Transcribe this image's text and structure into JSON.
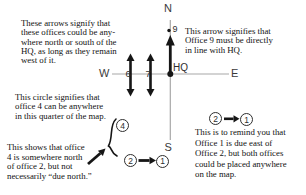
{
  "notes": {
    "west_arrows": "These arrows signify that\nthese offices could be any-\nwhere north or south of the\nHQ, as long as they remain\nwest of it.",
    "office9": "This arrow signifies that\nOffice 9 must be directly\nin line with HQ.",
    "circle4": "This circle signifies that\noffice 4 can be anywhere\nin this quarter of the map.",
    "north_of_2": "This shows that office\n4 is somewhere north\nof office 2, but not\nnecessarily “due north.”",
    "reminder": "This is to remind you that\nOffice 1 is due east of\nOffice 2, but both offices\ncould be placed anywhere\non the map."
  },
  "compass": {
    "north": "N",
    "south": "S",
    "east": "E",
    "west": "W",
    "hq": "HQ"
  },
  "offices": {
    "six": "6",
    "seven": "7",
    "nine": "9",
    "four": "4",
    "two": "2",
    "one": "1"
  },
  "reminder_pair": {
    "from": "2",
    "to": "1"
  },
  "colors": {
    "axis_line": "#a8a8a8",
    "ink": "#161616",
    "text": "#111111"
  }
}
